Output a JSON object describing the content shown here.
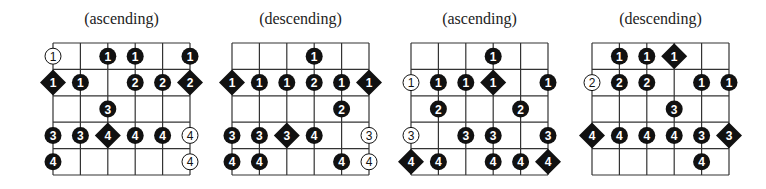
{
  "diagrams": [
    {
      "title": "(ascending)",
      "grid_left": 53,
      "rows": [
        [
          {
            "t": "o",
            "n": "1"
          },
          null,
          {
            "t": "f",
            "n": "1"
          },
          {
            "t": "f",
            "n": "1"
          },
          null,
          {
            "t": "f",
            "n": "1"
          }
        ],
        [
          {
            "t": "d",
            "n": "1"
          },
          {
            "t": "f",
            "n": "1"
          },
          null,
          {
            "t": "f",
            "n": "2"
          },
          {
            "t": "f",
            "n": "2"
          },
          {
            "t": "d",
            "n": "2"
          }
        ],
        [
          null,
          null,
          {
            "t": "f",
            "n": "3"
          },
          null,
          null,
          null
        ],
        [
          {
            "t": "f",
            "n": "3"
          },
          {
            "t": "f",
            "n": "3"
          },
          {
            "t": "d",
            "n": "4"
          },
          {
            "t": "f",
            "n": "4"
          },
          {
            "t": "f",
            "n": "4"
          },
          {
            "t": "o",
            "n": "4"
          }
        ],
        [
          {
            "t": "f",
            "n": "4"
          },
          null,
          null,
          null,
          null,
          {
            "t": "o",
            "n": "4"
          }
        ]
      ]
    },
    {
      "title": "(descending)",
      "grid_left": 232,
      "rows": [
        [
          null,
          null,
          null,
          {
            "t": "f",
            "n": "1"
          },
          null,
          null
        ],
        [
          {
            "t": "d",
            "n": "1"
          },
          {
            "t": "f",
            "n": "1"
          },
          {
            "t": "f",
            "n": "1"
          },
          {
            "t": "f",
            "n": "2"
          },
          {
            "t": "f",
            "n": "1"
          },
          {
            "t": "d",
            "n": "1"
          }
        ],
        [
          null,
          null,
          null,
          null,
          {
            "t": "f",
            "n": "2"
          },
          null
        ],
        [
          {
            "t": "f",
            "n": "3"
          },
          {
            "t": "f",
            "n": "3"
          },
          {
            "t": "d",
            "n": "3"
          },
          {
            "t": "f",
            "n": "4"
          },
          null,
          {
            "t": "o",
            "n": "3"
          }
        ],
        [
          {
            "t": "f",
            "n": "4"
          },
          {
            "t": "f",
            "n": "4"
          },
          null,
          null,
          {
            "t": "f",
            "n": "4"
          },
          {
            "t": "o",
            "n": "4"
          }
        ]
      ]
    },
    {
      "title": "(ascending)",
      "grid_left": 411,
      "rows": [
        [
          null,
          null,
          null,
          {
            "t": "f",
            "n": "1"
          },
          null,
          null
        ],
        [
          {
            "t": "o",
            "n": "1"
          },
          {
            "t": "f",
            "n": "1"
          },
          {
            "t": "f",
            "n": "1"
          },
          {
            "t": "d",
            "n": "1"
          },
          null,
          {
            "t": "f",
            "n": "1"
          }
        ],
        [
          null,
          {
            "t": "f",
            "n": "2"
          },
          null,
          null,
          {
            "t": "f",
            "n": "2"
          },
          null
        ],
        [
          {
            "t": "o",
            "n": "3"
          },
          null,
          {
            "t": "f",
            "n": "3"
          },
          {
            "t": "f",
            "n": "3"
          },
          null,
          {
            "t": "f",
            "n": "3"
          }
        ],
        [
          {
            "t": "d",
            "n": "4"
          },
          {
            "t": "f",
            "n": "4"
          },
          null,
          {
            "t": "f",
            "n": "4"
          },
          {
            "t": "f",
            "n": "4"
          },
          {
            "t": "d",
            "n": "4"
          }
        ]
      ]
    },
    {
      "title": "(descending)",
      "grid_left": 592,
      "rows": [
        [
          null,
          {
            "t": "f",
            "n": "1"
          },
          {
            "t": "f",
            "n": "1"
          },
          {
            "t": "d",
            "n": "1"
          },
          null,
          null
        ],
        [
          {
            "t": "o",
            "n": "2"
          },
          {
            "t": "f",
            "n": "2"
          },
          {
            "t": "f",
            "n": "2"
          },
          null,
          {
            "t": "f",
            "n": "1"
          },
          {
            "t": "f",
            "n": "1"
          }
        ],
        [
          null,
          null,
          null,
          {
            "t": "f",
            "n": "3"
          },
          null,
          null
        ],
        [
          {
            "t": "d",
            "n": "4"
          },
          {
            "t": "f",
            "n": "4"
          },
          {
            "t": "f",
            "n": "4"
          },
          {
            "t": "f",
            "n": "4"
          },
          {
            "t": "f",
            "n": "3"
          },
          {
            "t": "d",
            "n": "3"
          }
        ],
        [
          null,
          null,
          null,
          null,
          {
            "t": "f",
            "n": "4"
          },
          null
        ]
      ]
    }
  ],
  "legend": {
    "filled_circle": "fingered note",
    "open_circle": "open / alternate note",
    "diamond": "root note"
  },
  "colors": {
    "ink": "#111111",
    "grid": "#333333",
    "background": "#ffffff"
  }
}
